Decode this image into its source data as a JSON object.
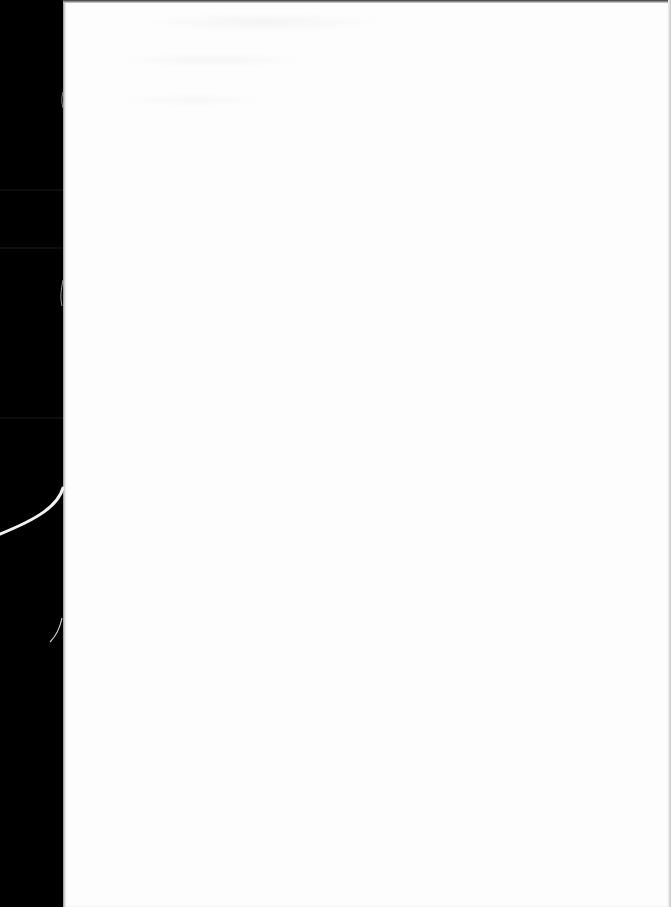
{
  "document": {
    "type": "scanned-blank-page",
    "page_text": "",
    "colors": {
      "background": "#000000",
      "paper": "#fdfdfd",
      "thread": "#f2f2f2"
    }
  }
}
